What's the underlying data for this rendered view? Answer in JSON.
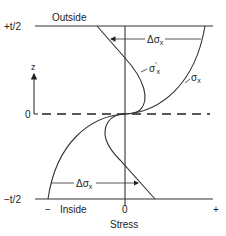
{
  "diagram": {
    "labels": {
      "top_surface": "+t/2",
      "top_side": "Outside",
      "bottom_surface": "−t/2",
      "bottom_side": "Inside",
      "midplane": "0",
      "z_axis": "z",
      "x_axis": "Stress",
      "x_zero": "0",
      "x_minus": "−",
      "x_plus": "+"
    },
    "curves": [
      {
        "name": "sigma_x",
        "label": "σx",
        "description": "bent stress curve"
      },
      {
        "name": "sigma_x_prime",
        "label": "σ′x",
        "description": "modified/linear stress curve"
      }
    ],
    "annotations": [
      {
        "name": "delta-sigma-top",
        "label": "Δσx",
        "direction": "left"
      },
      {
        "name": "delta-sigma-bottom",
        "label": "Δσx",
        "direction": "right"
      }
    ],
    "colors": {
      "line": "#333333",
      "background": "#ffffff"
    }
  }
}
